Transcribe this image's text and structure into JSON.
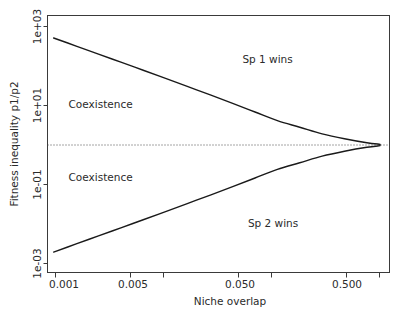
{
  "chart_data": {
    "type": "line",
    "title": "",
    "xlabel": "Niche overlap",
    "ylabel": "Fitness inequality p1/p2",
    "xscale": "log",
    "yscale": "log",
    "xlim": [
      0.0008,
      0.9
    ],
    "ylim": [
      0.0007,
      1400
    ],
    "grid": false,
    "legend": "none",
    "xticks": [
      {
        "value": 0.001,
        "label": "0.001"
      },
      {
        "value": 0.005,
        "label": "0.005"
      },
      {
        "value": 0.05,
        "label": "0.050"
      },
      {
        "value": 0.5,
        "label": "0.500"
      }
    ],
    "yticks": [
      {
        "value": 1000,
        "label": "1e+03"
      },
      {
        "value": 10,
        "label": "1e+01"
      },
      {
        "value": 0.1,
        "label": "1e-01"
      },
      {
        "value": 0.001,
        "label": "1e-03"
      }
    ],
    "reference_lines": [
      {
        "name": "equal-fitness",
        "orientation": "horizontal",
        "value": 1,
        "style": "dotted"
      }
    ],
    "series": [
      {
        "name": "upper-boundary",
        "description": "1 / niche overlap (upper coexistence limit)",
        "style": "solid",
        "x": [
          0.0008,
          0.0013,
          0.0021,
          0.0034,
          0.0055,
          0.0089,
          0.0144,
          0.0233,
          0.0377,
          0.061,
          0.0987,
          0.1597,
          0.2585,
          0.4183,
          0.6769,
          0.9
        ],
        "y": [
          512.0,
          320.0,
          200.0,
          125.0,
          78.0,
          48.5,
          30.0,
          18.5,
          11.3,
          6.85,
          4.12,
          2.82,
          1.92,
          1.44,
          1.14,
          1.04
        ]
      },
      {
        "name": "lower-boundary",
        "description": "niche overlap (lower coexistence limit)",
        "style": "solid",
        "x": [
          0.0008,
          0.0013,
          0.0021,
          0.0034,
          0.0055,
          0.0089,
          0.0144,
          0.0233,
          0.0377,
          0.061,
          0.0987,
          0.1597,
          0.2585,
          0.4183,
          0.6769,
          0.9
        ],
        "y": [
          0.00195,
          0.00313,
          0.005,
          0.008,
          0.01282,
          0.02062,
          0.03333,
          0.05405,
          0.0885,
          0.14599,
          0.24272,
          0.35461,
          0.52083,
          0.69444,
          0.87719,
          0.96154
        ]
      }
    ],
    "annotations": [
      {
        "name": "sp1-wins",
        "text": "Sp 1 wins",
        "x": 0.08,
        "y": 120
      },
      {
        "name": "sp2-wins",
        "text": "Sp 2 wins",
        "x": 0.09,
        "y": 0.0085
      },
      {
        "name": "coexistence-upper",
        "text": "Coexistence",
        "x": 0.0022,
        "y": 8.5
      },
      {
        "name": "coexistence-lower",
        "text": "Coexistence",
        "x": 0.0022,
        "y": 0.125
      }
    ]
  },
  "axes": {
    "x_title": "Niche overlap",
    "y_title": "Fitness inequality p1/p2",
    "x_tick_labels": [
      "0.001",
      "0.005",
      "0.050",
      "0.500"
    ],
    "y_tick_labels": [
      "1e+03",
      "1e+01",
      "1e-01",
      "1e-03"
    ]
  },
  "labels": {
    "sp1_wins": "Sp 1 wins",
    "sp2_wins": "Sp 2 wins",
    "coexistence_upper": "Coexistence",
    "coexistence_lower": "Coexistence"
  },
  "colors": {
    "curve": "#1a1a1a",
    "frame": "#3a3a3a",
    "dotted": "#4a4a4a",
    "text": "#2b2b2b",
    "background": "#ffffff"
  }
}
